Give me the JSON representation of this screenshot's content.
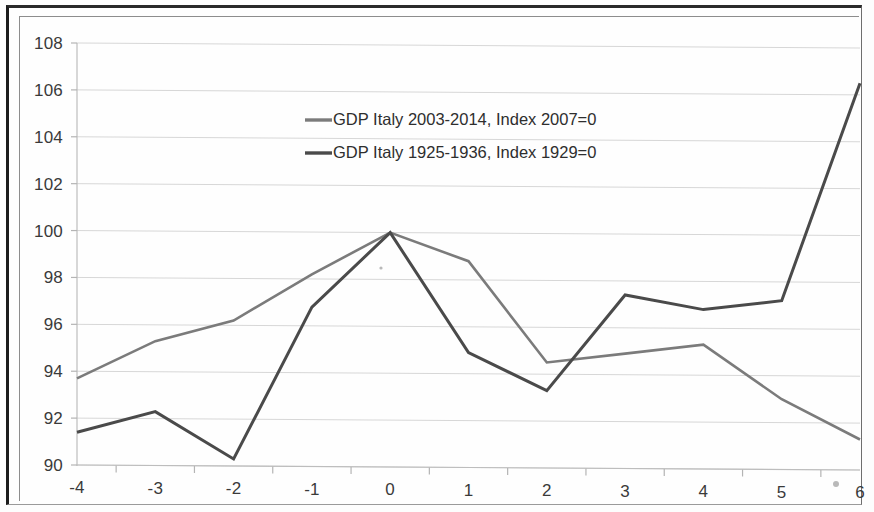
{
  "chart_data": {
    "type": "line",
    "title": "",
    "subtitle": "",
    "xlabel": "",
    "ylabel": "",
    "x": [
      -4,
      -3,
      -2,
      -1,
      0,
      1,
      2,
      3,
      4,
      5,
      6
    ],
    "xtick_labels": [
      "-4",
      "-3",
      "-2",
      "-1",
      "0",
      "1",
      "2",
      "3",
      "4",
      "5",
      "6"
    ],
    "ytick_labels": [
      "90",
      "92",
      "94",
      "96",
      "98",
      "100",
      "102",
      "104",
      "106",
      "108"
    ],
    "yticks": [
      90,
      92,
      94,
      96,
      98,
      100,
      102,
      104,
      106,
      108
    ],
    "ylim": [
      90,
      108
    ],
    "xlim": [
      -4,
      6
    ],
    "grid": true,
    "grid_axis": "y",
    "legend_position": "inside-upper-center",
    "series": [
      {
        "name": "GDP Italy 2003-2014, Index 2007=0",
        "color": "#7b7b7b",
        "linewidth": 2.6,
        "values": [
          93.7,
          95.3,
          96.2,
          98.2,
          100.0,
          98.8,
          94.5,
          94.9,
          95.3,
          93.0,
          91.3
        ]
      },
      {
        "name": "GDP Italy 1925-1936, Index 1929=0",
        "color": "#4a4a4a",
        "linewidth": 3.0,
        "values": [
          91.4,
          92.3,
          90.3,
          96.8,
          100.0,
          94.9,
          93.3,
          97.4,
          96.8,
          97.2,
          106.5
        ]
      }
    ]
  },
  "legend": {
    "entries": [
      {
        "label": "GDP Italy 2003-2014, Index 2007=0"
      },
      {
        "label": "GDP Italy 1925-1936, Index 1929=0"
      }
    ]
  },
  "figure": {
    "background_color": "#fdfdfd",
    "plot_background_color": "#ffffff",
    "border_color": "#1c1c1c"
  }
}
